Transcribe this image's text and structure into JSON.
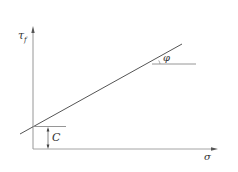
{
  "diagram": {
    "type": "mohr-coulomb-failure-envelope",
    "y_axis_label": "τ",
    "y_axis_subscript": "f",
    "x_axis_label": "σ",
    "intercept_label": "C",
    "angle_label": "φ",
    "colors": {
      "line": "#555555",
      "axis": "#9a9a9a",
      "text": "#333333"
    }
  }
}
